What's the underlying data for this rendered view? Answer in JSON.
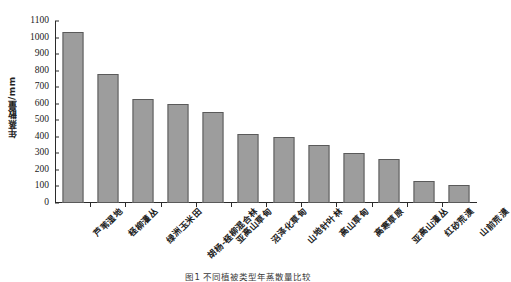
{
  "chart_data": {
    "type": "bar",
    "title": "",
    "xlabel": "",
    "ylabel": "年蒸散量/mm",
    "ylim": [
      0,
      1100
    ],
    "ytick_step": 100,
    "yticks": [
      0,
      100,
      200,
      300,
      400,
      500,
      600,
      700,
      800,
      900,
      1000,
      1100
    ],
    "grid": false,
    "legend": null,
    "bar_color": "#9d9d9d",
    "bar_edge_color": "#5a5a5a",
    "axis_color": "#2b2b2b",
    "categories": [
      "芦苇湿地",
      "柽柳灌丛",
      "绿洲玉米田",
      "胡杨-柽柳混合林",
      "亚高山草甸",
      "沼泽化草甸",
      "山地针叶林",
      "高山草甸",
      "高寒草原",
      "亚高山灌丛",
      "红砂荒漠",
      "山前荒漠"
    ],
    "values": [
      1035,
      780,
      630,
      600,
      553,
      415,
      400,
      350,
      305,
      265,
      135,
      110
    ]
  },
  "caption": {
    "text": "图1  不同植被类型年蒸散量比较"
  }
}
